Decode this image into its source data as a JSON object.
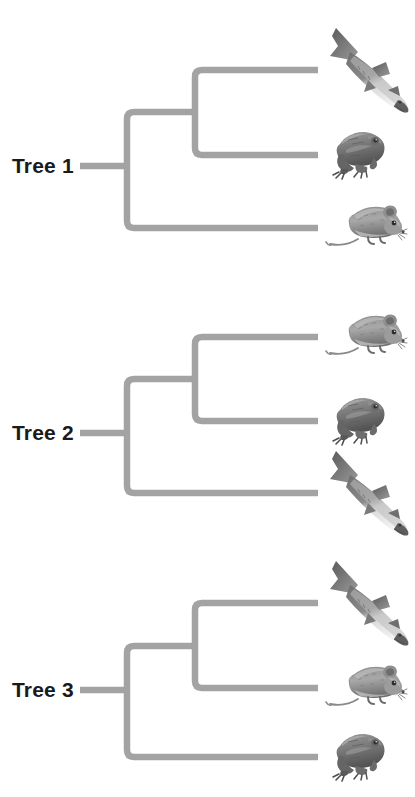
{
  "figure": {
    "type": "phylogenetic-tree-comparison",
    "background_color": "#ffffff",
    "branch_color": "#a3a3a3",
    "label_color": "#1a1a1a",
    "taxa": [
      "shark",
      "frog",
      "mouse"
    ],
    "geometry": {
      "root_stem_x_start": 80,
      "root_node_x": 127,
      "inner_node_x": 195,
      "tip_x": 318,
      "stroke_width": 6.5
    }
  },
  "trees": [
    {
      "id": "tree-1",
      "label": "Tree 1",
      "label_y": 166,
      "block_top": 0,
      "root_y": 166,
      "inner_node_y": 112,
      "tips": [
        {
          "taxon": "shark",
          "y": 70
        },
        {
          "taxon": "frog",
          "y": 155
        },
        {
          "taxon": "mouse",
          "y": 228
        }
      ],
      "topology": "((shark,frog),mouse)",
      "clade_order_top_to_bottom": [
        "shark",
        "frog",
        "mouse"
      ]
    },
    {
      "id": "tree-2",
      "label": "Tree 2",
      "label_y": 433,
      "block_top": 267,
      "root_y": 433,
      "inner_node_y": 379,
      "tips": [
        {
          "taxon": "mouse",
          "y": 337
        },
        {
          "taxon": "frog",
          "y": 421
        },
        {
          "taxon": "shark",
          "y": 493
        }
      ],
      "topology": "((mouse,frog),shark)",
      "clade_order_top_to_bottom": [
        "mouse",
        "frog",
        "shark"
      ]
    },
    {
      "id": "tree-3",
      "label": "Tree 3",
      "label_y": 690,
      "block_top": 533,
      "root_y": 690,
      "inner_node_y": 646,
      "tips": [
        {
          "taxon": "shark",
          "y": 603
        },
        {
          "taxon": "mouse",
          "y": 688
        },
        {
          "taxon": "frog",
          "y": 757
        }
      ],
      "topology": "((shark,mouse),frog)",
      "clade_order_top_to_bottom": [
        "shark",
        "mouse",
        "frog"
      ]
    }
  ],
  "taxon_art": {
    "shark": {
      "name": "shark-illustration",
      "width": 92,
      "height": 96,
      "offset_x": 6,
      "offset_y": -48
    },
    "frog": {
      "name": "frog-illustration",
      "width": 64,
      "height": 62,
      "offset_x": 10,
      "offset_y": -33
    },
    "mouse": {
      "name": "mouse-illustration",
      "width": 84,
      "height": 58,
      "offset_x": 6,
      "offset_y": -32
    }
  }
}
